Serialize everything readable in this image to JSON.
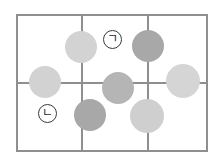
{
  "figure": {
    "background_color": "#ffffff",
    "width": 221,
    "height": 159
  },
  "grid": {
    "rows": 2,
    "columns": 3,
    "line_color": "#8f8f8f",
    "border_color": "#8f8f8f",
    "frame": {
      "left": 16,
      "top": 14,
      "width": 192,
      "height": 138
    },
    "vertical_dividers_x": [
      81,
      147
    ],
    "horizontal_dividers_y": [
      82
    ]
  },
  "labels": [
    {
      "id": "label-giyeok",
      "text": "ㄱ",
      "cell": "row1-col2",
      "left": 103,
      "top": 30,
      "border_color": "#3a3a3a"
    },
    {
      "id": "label-nieun",
      "text": "ㄴ",
      "cell": "row2-col1",
      "left": 38,
      "top": 104,
      "border_color": "#3a3a3a"
    }
  ],
  "circles": [
    {
      "id": "circle-1",
      "cx": 81,
      "cy": 47,
      "r": 16,
      "color": "#d3d3d3",
      "shade": "light"
    },
    {
      "id": "circle-2",
      "cx": 45,
      "cy": 82,
      "r": 16,
      "color": "#d2d2d2",
      "shade": "light"
    },
    {
      "id": "circle-3",
      "cx": 148,
      "cy": 46,
      "r": 16,
      "color": "#a8a8a8",
      "shade": "dark"
    },
    {
      "id": "circle-4",
      "cx": 118,
      "cy": 88,
      "r": 16,
      "color": "#b5b5b5",
      "shade": "medium"
    },
    {
      "id": "circle-5",
      "cx": 183,
      "cy": 81,
      "r": 17,
      "color": "#d5d5d5",
      "shade": "light"
    },
    {
      "id": "circle-6",
      "cx": 90,
      "cy": 115,
      "r": 16,
      "color": "#a8a8a8",
      "shade": "dark"
    },
    {
      "id": "circle-7",
      "cx": 147,
      "cy": 116,
      "r": 17,
      "color": "#cfcfcf",
      "shade": "light"
    }
  ],
  "chart_data": {
    "type": "diagram",
    "grid_rows": 2,
    "grid_columns": 3,
    "circle_count": 7,
    "annotations": [
      "ㄱ",
      "ㄴ"
    ]
  }
}
